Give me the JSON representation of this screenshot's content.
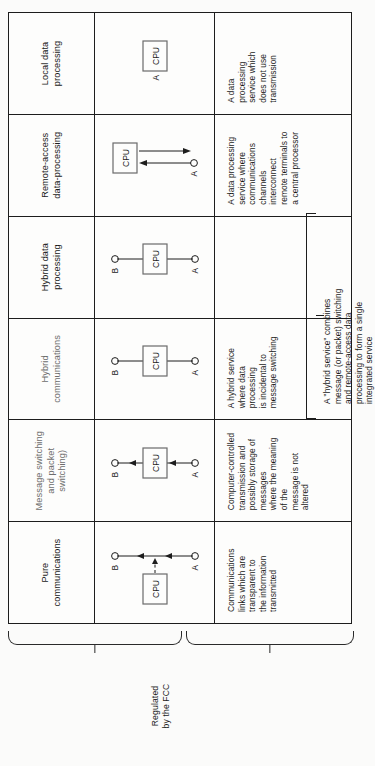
{
  "figure": {
    "orientation": "rotated-90-ccw",
    "captions": {
      "regulated": "Regulated\nby the FCC",
      "separate": "which has separate facilities, officers, and\naccounting"
    },
    "note": "A \"hybrid service\" combines\nmessage (or packet) switching\nand remote-access data\nprocessing to form a single\nintegrated service"
  },
  "columns": [
    {
      "key": "pure-communications",
      "header": "Pure\ncommunications",
      "header_style": "normal",
      "diagram": "A-circle to B-circle with arrows, CPU box offset left joined by dashed arrow",
      "diagram_labels": {
        "a": "A",
        "b": "B",
        "cpu": "CPU"
      },
      "description": "Communications\nlinks which are\ntransparent to\nthe information\ntransmitted"
    },
    {
      "key": "message-switching",
      "header": "Message switching\nand packet\nswitching)",
      "header_style": "light",
      "diagram": "A-circle up through arrow to CPU box, then arrow up to B-circle",
      "diagram_labels": {
        "a": "A",
        "b": "B",
        "cpu": "CPU"
      },
      "description": "Computer-controlled\ntransmission and\npossibly storage of messages\nwhere the meaning of the\nmessage is not altered"
    },
    {
      "key": "hybrid-communications",
      "header": "Hybrid\ncommunications",
      "header_style": "light",
      "diagram": "A-circle to CPU box to B-circle, plain lines",
      "diagram_labels": {
        "a": "A",
        "b": "B",
        "cpu": "CPU"
      },
      "description": "A hybrid service\nwhere data processing\nis incidental to\nmessage switching"
    },
    {
      "key": "hybrid-data-processing",
      "header": "Hybrid data\nprocessing",
      "header_style": "normal",
      "diagram": "A-circle to CPU box to B-circle, plain lines",
      "diagram_labels": {
        "a": "A",
        "b": "B",
        "cpu": "CPU"
      },
      "description": ""
    },
    {
      "key": "remote-access-data-processing",
      "header": "Remote-access\ndata-processing",
      "header_style": "normal",
      "diagram": "A-circle with two arrows, one up to CPU box and one down from CPU box",
      "diagram_labels": {
        "a": "A",
        "cpu": "CPU"
      },
      "description": "A data processing\nservice where\ncommunications\nchannels interconnect\nremote terminals to\na central processor"
    },
    {
      "key": "local-data-processing",
      "header": "Local data\nprocessing",
      "header_style": "normal",
      "diagram": "Standalone CPU box labelled A",
      "diagram_labels": {
        "a": "A",
        "cpu": "CPU"
      },
      "description": "A data\nprocessing\nservice which\ndoes not use\ntransmission"
    }
  ],
  "colors": {
    "ink": "#1d1d1d",
    "paper": "#fdfdfc",
    "muted": "#6d6d6d"
  }
}
